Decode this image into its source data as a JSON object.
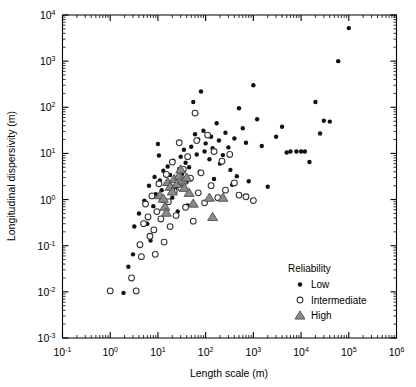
{
  "figure": {
    "background": "#ffffff",
    "width": 416,
    "height": 387
  },
  "chart_data": {
    "type": "scatter",
    "title": "",
    "xlabel": "Length scale (m)",
    "ylabel": "Longitudinal dispersivity (m)",
    "xscale": "log",
    "yscale": "log",
    "xlim": [
      0.1,
      1000000
    ],
    "ylim": [
      0.001,
      10000
    ],
    "xtick_labels": [
      "10⁻¹",
      "10⁰",
      "10¹",
      "10²",
      "10³",
      "10⁴",
      "10⁵",
      "10⁶"
    ],
    "xtick_values": [
      0.1,
      1,
      10,
      100,
      1000,
      10000,
      100000,
      1000000
    ],
    "ytick_labels": [
      "10⁻³",
      "10⁻²",
      "10⁻¹",
      "10⁰",
      "10¹",
      "10²",
      "10³",
      "10⁴"
    ],
    "ytick_values": [
      0.001,
      0.01,
      0.1,
      1,
      10,
      100,
      1000,
      10000
    ],
    "grid": false,
    "minor_ticks": true,
    "legend_position": "lower right",
    "legend_title": "Reliability",
    "series": [
      {
        "name": "Low",
        "marker": "filled-circle",
        "color": "#111111",
        "points": [
          [
            1.9,
            0.0095
          ],
          [
            2.4,
            0.035
          ],
          [
            3.0,
            0.065
          ],
          [
            3.2,
            0.26
          ],
          [
            4.0,
            0.5
          ],
          [
            5.2,
            0.95
          ],
          [
            6.0,
            0.3
          ],
          [
            6.5,
            2.0
          ],
          [
            7.0,
            0.13
          ],
          [
            8.0,
            0.72
          ],
          [
            8.5,
            3.1
          ],
          [
            9.0,
            1.3
          ],
          [
            10.0,
            16.0
          ],
          [
            10.5,
            9.0
          ],
          [
            11.0,
            2.6
          ],
          [
            12.0,
            1.6
          ],
          [
            13.0,
            4.2
          ],
          [
            14.0,
            0.95
          ],
          [
            15.0,
            2.2
          ],
          [
            16.0,
            5.2
          ],
          [
            18.0,
            3.4
          ],
          [
            20.0,
            1.1
          ],
          [
            21.0,
            7.0
          ],
          [
            22.0,
            2.9
          ],
          [
            24.0,
            1.9
          ],
          [
            26.0,
            0.55
          ],
          [
            28.0,
            4.6
          ],
          [
            30.0,
            8.5
          ],
          [
            32.0,
            3.6
          ],
          [
            35.0,
            12.0
          ],
          [
            38.0,
            6.3
          ],
          [
            40.0,
            2.4
          ],
          [
            42.0,
            0.75
          ],
          [
            45.0,
            5.0
          ],
          [
            50.0,
            14.0
          ],
          [
            55.0,
            130.0
          ],
          [
            60.0,
            26.0
          ],
          [
            65.0,
            9.5
          ],
          [
            70.0,
            20.0
          ],
          [
            75.0,
            4.0
          ],
          [
            80.0,
            220.0
          ],
          [
            90.0,
            31.0
          ],
          [
            95.0,
            11.0
          ],
          [
            100.0,
            16.5
          ],
          [
            120.0,
            7.5
          ],
          [
            130.0,
            23.0
          ],
          [
            140.0,
            13.0
          ],
          [
            150.0,
            2.8
          ],
          [
            170.0,
            45.0
          ],
          [
            190.0,
            19.0
          ],
          [
            200.0,
            6.0
          ],
          [
            230.0,
            9.2
          ],
          [
            260.0,
            28.0
          ],
          [
            300.0,
            13.5
          ],
          [
            330.0,
            4.4
          ],
          [
            360.0,
            2.1
          ],
          [
            400.0,
            21.0
          ],
          [
            450.0,
            3.2
          ],
          [
            500.0,
            95.0
          ],
          [
            600.0,
            35.0
          ],
          [
            700.0,
            17.0
          ],
          [
            800.0,
            2.5
          ],
          [
            1000.0,
            300.0
          ],
          [
            1200.0,
            55.0
          ],
          [
            1500.0,
            14.5
          ],
          [
            2000.0,
            1.9
          ],
          [
            3000.0,
            23.0
          ],
          [
            4000.0,
            38.0
          ],
          [
            5000.0,
            10.5
          ],
          [
            6000.0,
            11.0
          ],
          [
            8000.0,
            11.0
          ],
          [
            10000.0,
            11.0
          ],
          [
            12000.0,
            11.0
          ],
          [
            15000.0,
            6.5
          ],
          [
            20000.0,
            130.0
          ],
          [
            25000.0,
            27.0
          ],
          [
            30000.0,
            51.0
          ],
          [
            40000.0,
            49.0
          ],
          [
            60000.0,
            1000.0
          ],
          [
            100000.0,
            5200.0
          ]
        ]
      },
      {
        "name": "Intermediate",
        "marker": "open-circle",
        "color": "#ffffff",
        "points": [
          [
            1.0,
            0.0105
          ],
          [
            2.8,
            0.02
          ],
          [
            3.5,
            0.0105
          ],
          [
            4.2,
            0.105
          ],
          [
            4.5,
            0.058
          ],
          [
            5.0,
            0.3
          ],
          [
            5.5,
            0.8
          ],
          [
            6.2,
            0.42
          ],
          [
            6.8,
            0.16
          ],
          [
            7.5,
            1.2
          ],
          [
            8.2,
            0.22
          ],
          [
            8.8,
            0.065
          ],
          [
            9.5,
            0.55
          ],
          [
            10.5,
            2.2
          ],
          [
            11.5,
            0.38
          ],
          [
            12.5,
            1.0
          ],
          [
            13.5,
            0.12
          ],
          [
            15.0,
            3.5
          ],
          [
            16.5,
            0.9
          ],
          [
            18.0,
            0.26
          ],
          [
            20.0,
            6.5
          ],
          [
            22.0,
            1.5
          ],
          [
            24.0,
            0.45
          ],
          [
            26.0,
            2.6
          ],
          [
            28.0,
            17.0
          ],
          [
            30.0,
            1.8
          ],
          [
            34.0,
            4.5
          ],
          [
            38.0,
            0.68
          ],
          [
            42.0,
            8.5
          ],
          [
            48.0,
            2.9
          ],
          [
            55.0,
            0.34
          ],
          [
            60.0,
            75.0
          ],
          [
            65.0,
            19.0
          ],
          [
            70.0,
            1.4
          ],
          [
            80.0,
            3.8
          ],
          [
            95.0,
            0.85
          ],
          [
            110.0,
            25.0
          ],
          [
            130.0,
            2.0
          ],
          [
            150.0,
            11.0
          ],
          [
            180.0,
            1.1
          ],
          [
            220.0,
            6.8
          ],
          [
            260.0,
            1.6
          ],
          [
            320.0,
            9.5
          ],
          [
            400.0,
            2.3
          ],
          [
            500.0,
            1.25
          ],
          [
            700.0,
            1.15
          ],
          [
            1000.0,
            0.95
          ]
        ]
      },
      {
        "name": "High",
        "marker": "triangle",
        "color": "#8a8a8a",
        "points": [
          [
            11.0,
            1.25
          ],
          [
            13.0,
            1.05
          ],
          [
            14.0,
            0.7
          ],
          [
            15.0,
            0.52
          ],
          [
            16.0,
            2.4
          ],
          [
            18.0,
            1.9
          ],
          [
            20.0,
            1.5
          ],
          [
            22.0,
            2.8
          ],
          [
            25.0,
            2.2
          ],
          [
            28.0,
            3.3
          ],
          [
            30.0,
            4.5
          ],
          [
            33.0,
            2.6
          ],
          [
            36.0,
            1.8
          ],
          [
            40.0,
            3.0
          ],
          [
            45.0,
            1.4
          ],
          [
            55.0,
            0.82
          ],
          [
            120.0,
            1.1
          ],
          [
            230.0,
            1.1
          ],
          [
            140.0,
            0.42
          ]
        ]
      }
    ]
  },
  "legend": {
    "title": "Reliability",
    "entries": [
      {
        "label": "Low",
        "marker": "filled-circle"
      },
      {
        "label": "Intermediate",
        "marker": "open-circle"
      },
      {
        "label": "High",
        "marker": "triangle"
      }
    ]
  }
}
